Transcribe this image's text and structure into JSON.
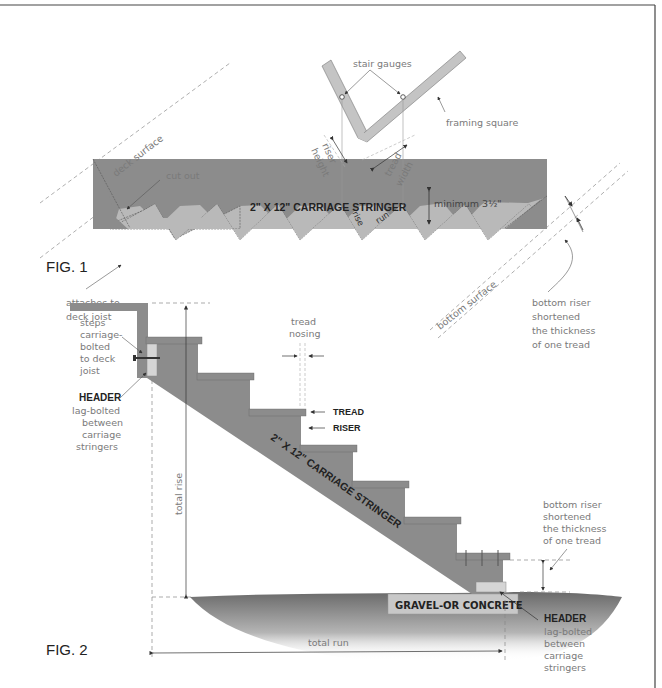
{
  "figure1": {
    "title": "FIG. 1",
    "stringer_label": "2\" X 12\" CARRIAGE STRINGER",
    "labels": {
      "stair_gauges": "stair gauges",
      "framing_square": "framing square",
      "riser_height_1": "riser",
      "riser_height_2": "height",
      "tread_width_1": "tread",
      "tread_width_2": "width",
      "deck_surface": "deck surface",
      "cut_out": "cut out",
      "rise": "rise",
      "run": "run",
      "minimum": "minimum 3½\"",
      "attaches_1": "attaches to",
      "attaches_2": "deck joist",
      "bottom_surface": "bottom surface",
      "bottom_riser_1": "bottom riser",
      "bottom_riser_2": "shortened",
      "bottom_riser_3": "the thickness",
      "bottom_riser_4": "of one tread"
    }
  },
  "figure2": {
    "title": "FIG. 2",
    "stringer_label": "2\" X 12\" CARRIAGE STRINGER",
    "labels": {
      "steps_1": "steps",
      "steps_2": "carriage-",
      "steps_3": "bolted",
      "steps_4": "to deck",
      "steps_5": "joist",
      "header_top": "HEADER",
      "header_top_1": "lag-bolted",
      "header_top_2": "between",
      "header_top_3": "carriage",
      "header_top_4": "stringers",
      "tread_nosing_1": "tread",
      "tread_nosing_2": "nosing",
      "tread": "TREAD",
      "riser": "RISER",
      "total_rise": "total rise",
      "total_run": "total run",
      "gravel": "GRAVEL-OR CONCRETE",
      "bottom_riser_1": "bottom riser",
      "bottom_riser_2": "shortened",
      "bottom_riser_3": "the thickness",
      "bottom_riser_4": "of one tread",
      "header_bottom": "HEADER",
      "header_bottom_1": "lag-bolted",
      "header_bottom_2": "between",
      "header_bottom_3": "carriage",
      "header_bottom_4": "stringers"
    }
  },
  "colors": {
    "wood_dark": "#8c8c8c",
    "wood_light": "#b9b9b9",
    "line": "#555555",
    "frame": "#444444"
  }
}
